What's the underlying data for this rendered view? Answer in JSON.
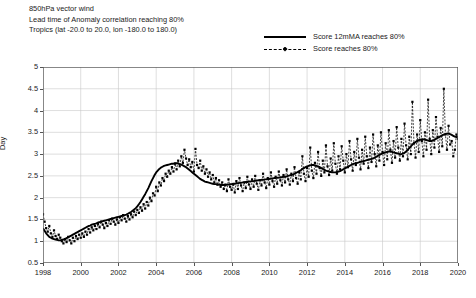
{
  "titles": [
    "850hPa vector wind",
    "Lead time of Anomaly correlation reaching 80%",
    "Tropics (lat -20.0 to 20.0, lon -180.0 to 180.0)"
  ],
  "legend": [
    {
      "label": "Score 12mMA reaches 80%",
      "style": "solid",
      "color": "#000000"
    },
    {
      "label": "Score reaches 80%",
      "style": "dashed-marker",
      "color": "#000000"
    }
  ],
  "chart_data": {
    "type": "line",
    "title": "Lead time of Anomaly correlation reaching 80%",
    "subtitle": "850hPa vector wind",
    "region": "Tropics (lat -20.0 to 20.0, lon -180.0 to 180.0)",
    "xlabel": "",
    "ylabel": "Day",
    "xlim": [
      1998,
      2020
    ],
    "ylim": [
      0.5,
      5
    ],
    "ytick_step": 0.5,
    "yticks": [
      0.5,
      1,
      1.5,
      2,
      2.5,
      3,
      3.5,
      4,
      4.5,
      5
    ],
    "xticks": [
      1998,
      2000,
      2002,
      2004,
      2006,
      2008,
      2010,
      2012,
      2014,
      2016,
      2018,
      2020
    ],
    "grid": true,
    "legend_position": "top-right",
    "x_start": 1998.0,
    "x_step": 0.08333,
    "series": [
      {
        "name": "Score reaches 80%",
        "style": "dashed-marker",
        "values": [
          1.62,
          1.45,
          1.3,
          1.22,
          1.35,
          1.18,
          1.1,
          1.25,
          1.12,
          1.05,
          1.15,
          1.08,
          1.0,
          0.95,
          1.05,
          0.98,
          1.1,
          1.02,
          0.95,
          1.08,
          1.0,
          1.12,
          1.05,
          1.15,
          1.08,
          1.18,
          1.1,
          1.22,
          1.15,
          1.28,
          1.2,
          1.32,
          1.25,
          1.35,
          1.28,
          1.4,
          1.32,
          1.45,
          1.38,
          1.3,
          1.42,
          1.35,
          1.48,
          1.4,
          1.52,
          1.45,
          1.38,
          1.5,
          1.42,
          1.55,
          1.48,
          1.6,
          1.52,
          1.45,
          1.58,
          1.5,
          1.62,
          1.55,
          1.68,
          1.6,
          1.72,
          1.65,
          1.78,
          1.7,
          1.85,
          1.75,
          1.9,
          1.82,
          2.0,
          1.92,
          2.1,
          2.05,
          2.25,
          2.15,
          2.35,
          2.28,
          2.45,
          2.38,
          2.55,
          2.48,
          2.62,
          2.55,
          2.7,
          2.6,
          2.78,
          2.65,
          2.85,
          2.72,
          2.95,
          2.8,
          3.1,
          2.9,
          2.75,
          2.88,
          2.7,
          2.82,
          2.6,
          3.12,
          2.75,
          2.68,
          2.85,
          2.62,
          2.72,
          2.55,
          2.65,
          2.48,
          2.58,
          2.42,
          2.52,
          2.35,
          2.45,
          2.3,
          2.4,
          2.25,
          2.35,
          2.2,
          2.3,
          2.15,
          2.42,
          2.25,
          2.18,
          2.3,
          2.12,
          2.38,
          2.2,
          2.45,
          2.28,
          2.15,
          2.35,
          2.22,
          2.48,
          2.3,
          2.2,
          2.42,
          2.25,
          2.5,
          2.32,
          2.18,
          2.4,
          2.28,
          2.55,
          2.35,
          2.22,
          2.45,
          2.3,
          2.58,
          2.38,
          2.25,
          2.48,
          2.32,
          2.6,
          2.4,
          2.28,
          2.52,
          2.35,
          2.65,
          2.42,
          2.3,
          2.55,
          2.38,
          2.7,
          2.45,
          2.32,
          2.58,
          2.42,
          2.95,
          2.55,
          2.38,
          2.68,
          2.48,
          3.15,
          2.62,
          2.45,
          2.8,
          2.55,
          3.05,
          2.68,
          2.5,
          2.85,
          2.58,
          3.2,
          2.72,
          2.52,
          2.9,
          2.62,
          3.25,
          2.78,
          2.55,
          2.95,
          2.65,
          3.18,
          2.85,
          2.58,
          3.0,
          2.7,
          3.3,
          2.88,
          2.62,
          3.05,
          2.75,
          3.35,
          2.92,
          2.65,
          3.1,
          2.78,
          3.4,
          2.95,
          2.68,
          3.15,
          2.82,
          3.45,
          3.0,
          2.72,
          3.2,
          2.85,
          3.5,
          3.05,
          2.75,
          3.25,
          2.88,
          3.55,
          3.1,
          2.8,
          3.3,
          2.92,
          3.62,
          3.15,
          2.85,
          3.35,
          2.95,
          3.7,
          3.2,
          2.88,
          3.4,
          3.0,
          4.2,
          3.25,
          2.92,
          3.45,
          3.05,
          3.78,
          3.3,
          2.95,
          3.5,
          3.1,
          4.25,
          3.35,
          3.0,
          3.55,
          3.15,
          3.85,
          3.4,
          3.05,
          3.6,
          3.18,
          4.5,
          3.45,
          3.1,
          3.65,
          3.22,
          3.3,
          2.95,
          3.1,
          3.45,
          3.35,
          3.55,
          3.7,
          3.9
        ]
      },
      {
        "name": "Score 12mMA reaches 80%",
        "style": "solid",
        "values": [
          1.3,
          1.24,
          1.18,
          1.14,
          1.1,
          1.08,
          1.06,
          1.05,
          1.04,
          1.03,
          1.02,
          1.02,
          1.03,
          1.04,
          1.05,
          1.07,
          1.09,
          1.11,
          1.13,
          1.15,
          1.17,
          1.19,
          1.21,
          1.23,
          1.25,
          1.27,
          1.29,
          1.31,
          1.33,
          1.35,
          1.36,
          1.38,
          1.39,
          1.4,
          1.41,
          1.43,
          1.44,
          1.45,
          1.46,
          1.47,
          1.48,
          1.49,
          1.5,
          1.51,
          1.52,
          1.53,
          1.54,
          1.55,
          1.56,
          1.57,
          1.58,
          1.59,
          1.6,
          1.61,
          1.63,
          1.65,
          1.67,
          1.7,
          1.73,
          1.76,
          1.8,
          1.85,
          1.9,
          1.96,
          2.02,
          2.08,
          2.15,
          2.22,
          2.3,
          2.38,
          2.45,
          2.52,
          2.58,
          2.62,
          2.66,
          2.69,
          2.71,
          2.73,
          2.74,
          2.75,
          2.76,
          2.77,
          2.78,
          2.78,
          2.79,
          2.79,
          2.78,
          2.77,
          2.76,
          2.74,
          2.72,
          2.7,
          2.67,
          2.64,
          2.61,
          2.58,
          2.55,
          2.52,
          2.49,
          2.46,
          2.43,
          2.41,
          2.39,
          2.37,
          2.36,
          2.35,
          2.34,
          2.33,
          2.32,
          2.31,
          2.31,
          2.3,
          2.3,
          2.29,
          2.29,
          2.29,
          2.29,
          2.3,
          2.3,
          2.31,
          2.31,
          2.32,
          2.32,
          2.33,
          2.33,
          2.34,
          2.34,
          2.35,
          2.35,
          2.36,
          2.36,
          2.37,
          2.37,
          2.38,
          2.38,
          2.39,
          2.39,
          2.4,
          2.4,
          2.41,
          2.41,
          2.42,
          2.42,
          2.43,
          2.43,
          2.44,
          2.44,
          2.45,
          2.45,
          2.46,
          2.46,
          2.47,
          2.47,
          2.48,
          2.48,
          2.49,
          2.5,
          2.51,
          2.52,
          2.53,
          2.55,
          2.57,
          2.59,
          2.61,
          2.63,
          2.66,
          2.68,
          2.7,
          2.72,
          2.73,
          2.74,
          2.75,
          2.75,
          2.74,
          2.73,
          2.72,
          2.7,
          2.68,
          2.66,
          2.64,
          2.62,
          2.61,
          2.6,
          2.59,
          2.58,
          2.58,
          2.58,
          2.59,
          2.6,
          2.61,
          2.63,
          2.65,
          2.67,
          2.69,
          2.71,
          2.73,
          2.75,
          2.77,
          2.78,
          2.79,
          2.8,
          2.81,
          2.82,
          2.83,
          2.84,
          2.85,
          2.86,
          2.87,
          2.88,
          2.89,
          2.9,
          2.92,
          2.94,
          2.96,
          2.98,
          3.0,
          3.02,
          3.03,
          3.04,
          3.05,
          3.06,
          3.06,
          3.05,
          3.04,
          3.03,
          3.02,
          3.01,
          3.0,
          3.0,
          3.01,
          3.03,
          3.06,
          3.1,
          3.14,
          3.18,
          3.22,
          3.25,
          3.28,
          3.3,
          3.32,
          3.33,
          3.34,
          3.34,
          3.33,
          3.32,
          3.31,
          3.3,
          3.3,
          3.31,
          3.33,
          3.35,
          3.37,
          3.39,
          3.41,
          3.43,
          3.45,
          3.46,
          3.47,
          3.47,
          3.46,
          3.44,
          3.42,
          3.4,
          3.39,
          3.4,
          3.43,
          3.48,
          3.55
        ]
      }
    ]
  }
}
